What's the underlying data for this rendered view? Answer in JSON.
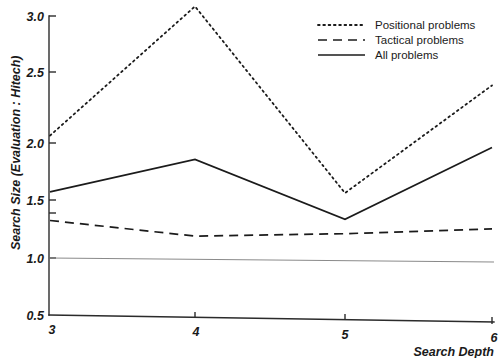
{
  "chart_data": {
    "type": "line",
    "title": "",
    "xlabel": "Search Depth",
    "ylabel": "Search Size (Evaluation : Hitech)",
    "x": [
      3,
      4,
      5,
      6
    ],
    "xtick_labels": [
      "3",
      "4",
      "5",
      "6"
    ],
    "ytick_labels": [
      "0.5",
      "1.0",
      "1.5",
      "2.0",
      "2.5",
      "3.0"
    ],
    "ytick_values": [
      0.5,
      1.0,
      1.5,
      2.0,
      2.5,
      3.0
    ],
    "xlim": [
      3,
      6
    ],
    "ylim": [
      0.5,
      3.0
    ],
    "grid": false,
    "legend_position": "top-right",
    "reference_line": {
      "name": "baseline",
      "y": 1.0,
      "style": "solid-thin",
      "color": "#8a8a8a"
    },
    "series": [
      {
        "name": "Positional problems",
        "style": "dotted",
        "color": "#1b1b1b",
        "values": [
          2.0,
          3.08,
          1.52,
          2.42
        ]
      },
      {
        "name": "Tactical problems",
        "style": "dashed",
        "color": "#1b1b1b",
        "values": [
          1.29,
          1.16,
          1.18,
          1.22
        ]
      },
      {
        "name": "All problems",
        "style": "solid",
        "color": "#1b1b1b",
        "values": [
          1.53,
          1.8,
          1.3,
          1.9
        ]
      }
    ]
  },
  "legend": {
    "entries": [
      {
        "label": "Positional problems",
        "style": "dotted"
      },
      {
        "label": "Tactical problems",
        "style": "dashed"
      },
      {
        "label": "All problems",
        "style": "solid"
      }
    ]
  },
  "axes": {
    "y_title": "Search Size (Evaluation : Hitech)",
    "x_title": "Search Depth",
    "y_ticks": [
      "3.0",
      "2.5",
      "2.0",
      "1.5",
      "1.0",
      "0.5"
    ],
    "x_ticks": [
      "3",
      "4",
      "5",
      "6"
    ]
  }
}
